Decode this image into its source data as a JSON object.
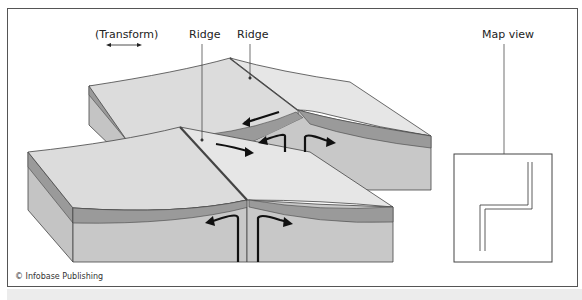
{
  "figure": {
    "labels": {
      "transform": "Transform",
      "ridge_left": "Ridge",
      "ridge_right": "Ridge",
      "map_view": "Map view"
    },
    "credit": "© Infobase Publishing",
    "colors": {
      "plate_top": "#dcdcdc",
      "plate_layer": "#9a9a9a",
      "plate_side": "#c4c4c4",
      "outline": "#444444",
      "arrow": "#111111"
    },
    "icons": {
      "transform_arrow": "double-headed-arrow",
      "motion_arrows": "curved-arrow"
    }
  }
}
